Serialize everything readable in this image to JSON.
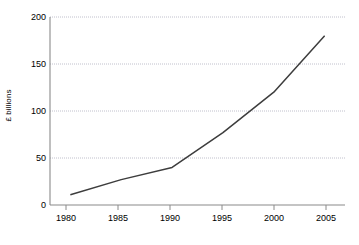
{
  "chart_data": {
    "type": "line",
    "title": "",
    "xlabel": "",
    "ylabel": "£ billions",
    "x": [
      1980,
      1985,
      1990,
      1995,
      2000,
      2005
    ],
    "values": [
      11,
      27,
      40,
      77,
      120,
      180
    ],
    "series": [
      {
        "name": "£ billions",
        "values": [
          11,
          27,
          40,
          77,
          120,
          180
        ]
      }
    ],
    "categories": [
      "1980",
      "1985",
      "1990",
      "1995",
      "2000",
      "2005"
    ],
    "xlim": [
      1978,
      2007
    ],
    "ylim": [
      0,
      200
    ],
    "y_ticks": [
      0,
      50,
      100,
      150,
      200
    ],
    "y_tick_labels": [
      "0",
      "50",
      "100",
      "150",
      "200"
    ],
    "x_ticks": [
      1980,
      1985,
      1990,
      1995,
      2000,
      2005
    ],
    "x_tick_labels": [
      "1980",
      "1985",
      "1990",
      "1995",
      "2000",
      "2005"
    ],
    "grid": "horizontal-dotted",
    "legend": "none",
    "line_color": "#3d3d3d",
    "grid_color": "#c8c8d2",
    "axis_color": "#808080"
  },
  "axes": {
    "y_title": "£ billions",
    "y_labels": [
      "200",
      "150",
      "100",
      "50",
      "0"
    ],
    "x_labels": [
      "1980",
      "1985",
      "1990",
      "1995",
      "2000",
      "2005"
    ]
  }
}
